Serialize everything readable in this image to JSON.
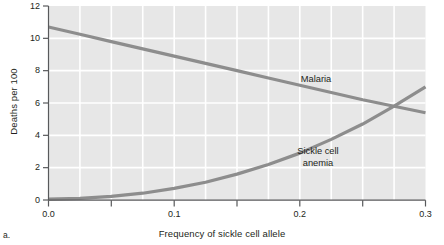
{
  "figure": {
    "panel_letter": "a."
  },
  "chart_data": {
    "type": "line",
    "title": "",
    "subtitle": "",
    "xlabel": "Frequency of sickle cell allele",
    "ylabel": "Deaths per 100",
    "xlim": [
      0.0,
      0.3
    ],
    "ylim": [
      0,
      12
    ],
    "grid": true,
    "grid_color": "#ffffff",
    "plot_background": "#e7e7e7",
    "legend_position": "inline-annotations",
    "x_ticks": [
      0.0,
      0.05,
      0.1,
      0.15,
      0.2,
      0.25,
      0.3
    ],
    "x_tick_labels": [
      "0.0",
      "",
      "0.1",
      "",
      "0.2",
      "",
      "0.3"
    ],
    "x_major_labels": [
      "0.0",
      "0.1",
      "0.2",
      "0.3"
    ],
    "y_ticks": [
      0,
      2,
      4,
      6,
      8,
      10,
      12
    ],
    "y_tick_labels": [
      "0",
      "2",
      "4",
      "6",
      "8",
      "10",
      "12"
    ],
    "series": [
      {
        "name": "Malaria",
        "color": "#8d8d8d",
        "label_position": {
          "x": 0.205,
          "y": 8.1
        },
        "x": [
          0.0,
          0.025,
          0.05,
          0.075,
          0.1,
          0.125,
          0.15,
          0.175,
          0.2,
          0.225,
          0.25,
          0.275,
          0.3
        ],
        "values": [
          10.7,
          10.25,
          9.8,
          9.35,
          8.9,
          8.45,
          8.0,
          7.55,
          7.1,
          6.65,
          6.2,
          5.8,
          5.4
        ]
      },
      {
        "name": "Sickle cell anemia",
        "color": "#8d8d8d",
        "label_line_1": "Sickle cell",
        "label_line_2": "anemia",
        "label_position": {
          "x": 0.207,
          "y": 3.2
        },
        "x": [
          0.0,
          0.025,
          0.05,
          0.075,
          0.1,
          0.125,
          0.15,
          0.175,
          0.2,
          0.225,
          0.25,
          0.275,
          0.3
        ],
        "values": [
          0.05,
          0.1,
          0.22,
          0.42,
          0.72,
          1.1,
          1.6,
          2.2,
          2.9,
          3.75,
          4.7,
          5.8,
          7.0
        ]
      }
    ],
    "intersection": {
      "x": 0.272,
      "y": 5.95
    }
  }
}
